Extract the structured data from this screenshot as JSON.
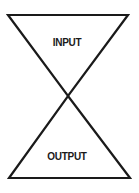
{
  "diagram": {
    "top_label": "INPUT",
    "bottom_label": "OUTPUT",
    "stroke_color": "#1a1a1a",
    "background": "#ffffff"
  }
}
